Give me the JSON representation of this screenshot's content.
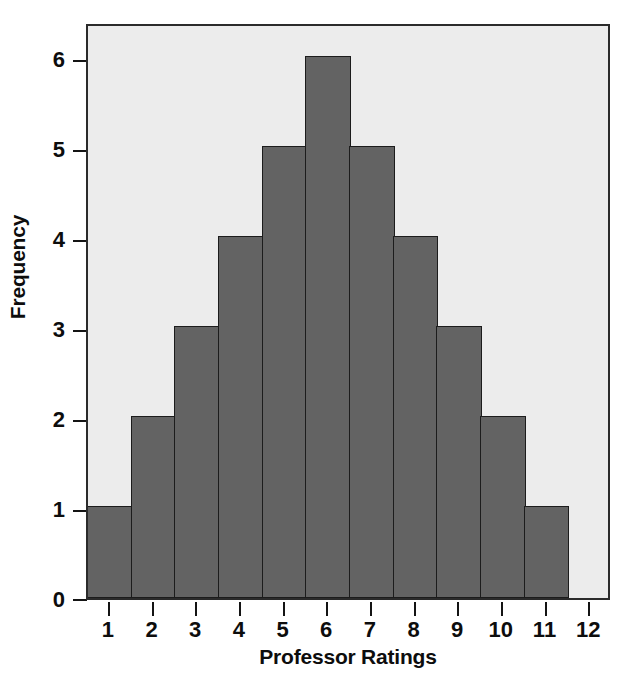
{
  "chart_data": {
    "type": "bar",
    "title": "",
    "xlabel": "Professor Ratings",
    "ylabel": "Frequency",
    "categories": [
      "1",
      "2",
      "3",
      "4",
      "5",
      "6",
      "7",
      "8",
      "9",
      "10",
      "11"
    ],
    "values": [
      1,
      2,
      3,
      4,
      5,
      6,
      5,
      4,
      3,
      2,
      1
    ],
    "bin_edges": [
      0.5,
      1.5,
      2.5,
      3.5,
      4.5,
      5.5,
      6.5,
      7.5,
      8.5,
      9.5,
      10.5,
      11.5
    ],
    "xlim": [
      0.5,
      12.5
    ],
    "ylim": [
      0,
      6.4
    ],
    "x_tick_labels": [
      "1",
      "2",
      "3",
      "4",
      "5",
      "6",
      "7",
      "8",
      "9",
      "10",
      "11",
      "12"
    ],
    "x_tick_values": [
      1,
      2,
      3,
      4,
      5,
      6,
      7,
      8,
      9,
      10,
      11,
      12
    ],
    "y_tick_labels": [
      "0",
      "1",
      "2",
      "3",
      "4",
      "5",
      "6"
    ],
    "y_tick_values": [
      0,
      1,
      2,
      3,
      4,
      5,
      6
    ],
    "grid": false,
    "legend": null,
    "legend_position": "none",
    "colors": {
      "bar_fill": "#636363",
      "bar_edge": "#1c1c1c",
      "plot_background": "#ececec",
      "figure_background": "#ffffff",
      "axis": "#141414",
      "text": "#0d0d0d"
    }
  }
}
